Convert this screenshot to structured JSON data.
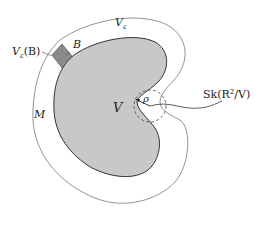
{
  "diagram": {
    "type": "geometric-figure",
    "colors": {
      "region_fill": "#c8c8c8",
      "region_stroke": "#333333",
      "outer_stroke": "#777777",
      "patch_fill": "#8a8a8a",
      "background": "#ffffff"
    },
    "labels": {
      "V": "V",
      "V_eps": "V",
      "V_eps_sub": "ε",
      "V_eps_B": "V",
      "V_eps_B_sub": "ε",
      "V_eps_B_arg": "(B)",
      "B": "B",
      "M": "M",
      "rho": "ρ",
      "skeleton": "Sk(R",
      "skeleton_sup": "2",
      "skeleton_tail": "/V)"
    }
  }
}
